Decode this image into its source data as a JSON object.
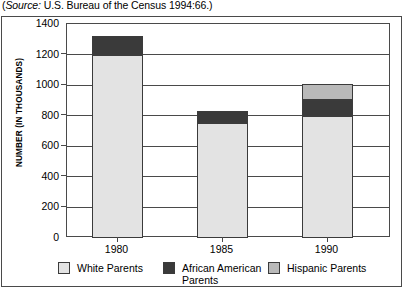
{
  "source_note": {
    "italic_prefix": "Source:",
    "rest": " U.S. Bureau of the Census 1994:66.)",
    "open_paren": "("
  },
  "chart_data": {
    "type": "bar",
    "subtype": "stacked-bar",
    "title": "",
    "xlabel": "",
    "ylabel": "NUMBER (IN THOUSANDS)",
    "categories": [
      "1980",
      "1985",
      "1990"
    ],
    "ylim": [
      0,
      1400
    ],
    "yticks": [
      0,
      200,
      400,
      600,
      800,
      1000,
      1200,
      1400
    ],
    "ytick_labels": [
      "0",
      "200",
      "400",
      "600",
      "800",
      "1000",
      "1200",
      "1400"
    ],
    "grid": true,
    "legend_position": "bottom",
    "series": [
      {
        "name": "White Parents",
        "color": "#e3e3e3",
        "values": [
          1200,
          750,
          800
        ]
      },
      {
        "name": "African American Parents",
        "color": "#3a3a3a",
        "values": [
          120,
          80,
          100
        ]
      },
      {
        "name": "Hispanic Parents",
        "color": "#b9b9b9",
        "values": [
          0,
          0,
          110
        ]
      }
    ],
    "totals": [
      1320,
      830,
      1010
    ],
    "segment_tops": {
      "1980": {
        "white": 1200,
        "african_american": 1320,
        "hispanic": 1320
      },
      "1985": {
        "white": 750,
        "african_american": 830,
        "hispanic": 830
      },
      "1990": {
        "white": 800,
        "african_american": 900,
        "hispanic": 1010
      }
    }
  },
  "legend": [
    {
      "label": "White Parents",
      "color": "#e3e3e3"
    },
    {
      "label": "African American\nParents",
      "color": "#3a3a3a"
    },
    {
      "label": "Hispanic Parents",
      "color": "#b9b9b9"
    }
  ]
}
